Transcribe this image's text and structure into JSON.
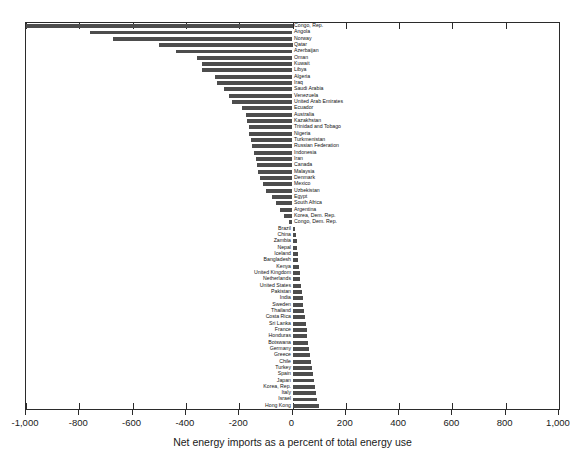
{
  "chart_data": {
    "type": "bar",
    "orientation": "horizontal",
    "title": "",
    "xlabel": "Net energy imports as a percent of total energy use",
    "ylabel": "",
    "xlim": [
      -1000,
      1000
    ],
    "xticks": [
      -1000,
      -800,
      -600,
      -400,
      -200,
      0,
      200,
      400,
      600,
      800,
      1000
    ],
    "xtick_labels": [
      "-1,000",
      "-800",
      "-600",
      "-400",
      "-200",
      "0",
      "200",
      "400",
      "600",
      "800",
      "1,000"
    ],
    "grid": false,
    "legend": null,
    "bar_color": "#4d4d4d",
    "frame_color": "#2b2b2b",
    "categories": [
      "Congo, Rep.",
      "Angola",
      "Norway",
      "Qatar",
      "Azerbaijan",
      "Oman",
      "Kuwait",
      "Libya",
      "Algeria",
      "Iraq",
      "Saudi Arabia",
      "Venezuela",
      "United Arab Emirates",
      "Ecuador",
      "Australia",
      "Kazakhstan",
      "Trinidad and Tobago",
      "Nigeria",
      "Turkmenistan",
      "Russian Federation",
      "Indonesia",
      "Iran",
      "Canada",
      "Malaysia",
      "Denmark",
      "Mexico",
      "Uzbekistan",
      "Egypt",
      "South Africa",
      "Argentina",
      "Korea, Dem. Rep.",
      "Congo, Dem. Rep.",
      "Brazil",
      "China",
      "Zambia",
      "Nepal",
      "Iceland",
      "Bangladesh",
      "Kenya",
      "United Kingdom",
      "Netherlands",
      "United States",
      "Pakistan",
      "India",
      "Sweden",
      "Thailand",
      "Costa Rica",
      "Sri Lanka",
      "France",
      "Honduras",
      "Botswana",
      "Germany",
      "Greece",
      "Chile",
      "Turkey",
      "Spain",
      "Japan",
      "Korea, Rep.",
      "Italy",
      "Israel",
      "Hong Kong"
    ],
    "values": [
      -1000,
      -760,
      -675,
      -500,
      -437,
      -357,
      -340,
      -338,
      -290,
      -285,
      -258,
      -238,
      -228,
      -190,
      -175,
      -170,
      -165,
      -163,
      -157,
      -152,
      -143,
      -138,
      -133,
      -130,
      -122,
      -110,
      -100,
      -78,
      -62,
      -48,
      -33,
      -15,
      10,
      13,
      16,
      18,
      20,
      22,
      25,
      27,
      30,
      33,
      35,
      38,
      40,
      44,
      47,
      50,
      53,
      56,
      59,
      62,
      65,
      68,
      72,
      76,
      80,
      84,
      87,
      91,
      100
    ],
    "unit": "percent"
  },
  "axis": {
    "title": "Net energy imports as a percent of total energy use"
  }
}
